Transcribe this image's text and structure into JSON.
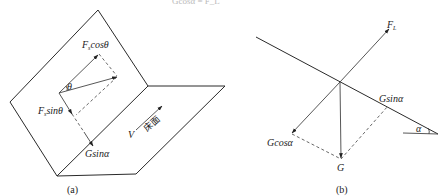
{
  "top_partial_text": "Gcosα = F_L",
  "panel_a": {
    "caption": "(a)",
    "labels": {
      "fs_cos": "F",
      "fs_cos_sub": "s",
      "fs_cos_rest": "cosθ",
      "theta": "θ",
      "fs_sin": "F",
      "fs_sin_sub": "s",
      "fs_sin_rest": "sinθ",
      "g_sin": "Gsinα",
      "v": "V",
      "floor": "床面"
    }
  },
  "panel_b": {
    "caption": "(b)",
    "labels": {
      "fl": "F",
      "fl_sub": "L",
      "g_sin": "Gsinα",
      "g_cos": "Gcosα",
      "g": "G",
      "alpha": "α"
    }
  }
}
